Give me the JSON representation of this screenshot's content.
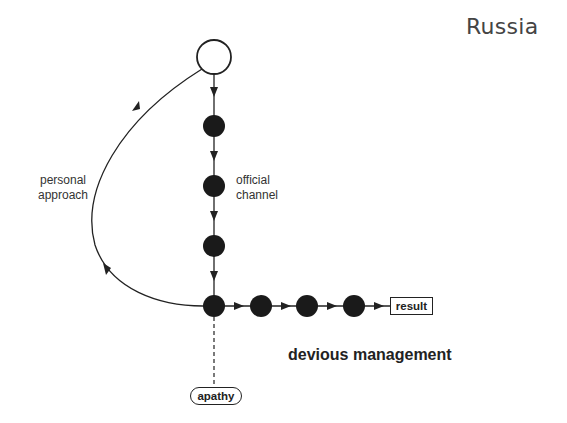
{
  "diagram": {
    "title": "Russia",
    "heading": "devious management",
    "labels": {
      "personal_approach": "personal\napproach",
      "official_channel": "official\nchannel"
    },
    "boxes": {
      "result": "result",
      "apathy": "apathy"
    },
    "nodes": {
      "start": {
        "type": "open-circle",
        "cx": 214,
        "cy": 57,
        "r": 17
      },
      "vertical": [
        {
          "cx": 214,
          "cy": 126
        },
        {
          "cx": 214,
          "cy": 186
        },
        {
          "cx": 214,
          "cy": 246
        },
        {
          "cx": 214,
          "cy": 306
        }
      ],
      "horizontal": [
        {
          "cx": 261,
          "cy": 306
        },
        {
          "cx": 307,
          "cy": 306
        },
        {
          "cx": 354,
          "cy": 306
        }
      ]
    },
    "edges": [
      {
        "from": "start",
        "to": "junction",
        "label": "personal approach",
        "style": "curve"
      },
      {
        "from": "start",
        "to": "junction",
        "label": "official channel",
        "style": "straight"
      },
      {
        "from": "junction",
        "to": "result",
        "style": "straight"
      },
      {
        "from": "junction",
        "to": "apathy",
        "style": "dashed"
      }
    ],
    "colors": {
      "stroke": "#222222",
      "node_fill": "#1a1a1a",
      "text": "#333333"
    }
  }
}
